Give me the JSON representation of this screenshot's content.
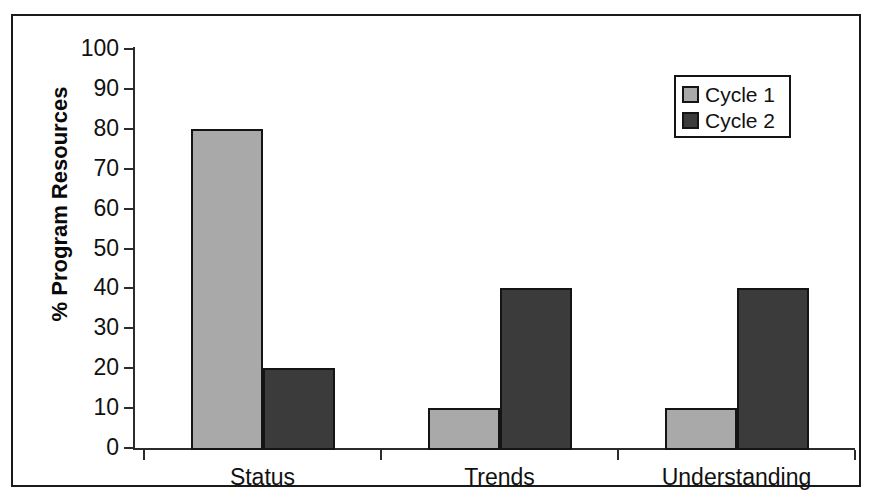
{
  "chart_data": {
    "type": "bar",
    "title": "",
    "subtitle": "",
    "xlabel": "",
    "ylabel": "% Program Resources",
    "categories": [
      "Status",
      "Trends",
      "Understanding"
    ],
    "series": [
      {
        "name": "Cycle 1",
        "color": "#a9a9a9",
        "values": [
          80,
          10,
          10
        ]
      },
      {
        "name": "Cycle 2",
        "color": "#3b3b3b",
        "values": [
          20,
          40,
          40
        ]
      }
    ],
    "ylim": [
      0,
      100
    ],
    "ytick_step": 10,
    "ytick_labels": [
      "100",
      "90",
      "80",
      "70",
      "60",
      "50",
      "40",
      "30",
      "20",
      "10",
      "0"
    ],
    "grid": false,
    "legend_position": "top-right",
    "legend_entries": [
      "Cycle 1",
      "Cycle 2"
    ],
    "frame": true,
    "annotations": []
  },
  "axis": {
    "y_title": "% Program Resources"
  },
  "legend": {
    "items": [
      {
        "label": "Cycle 1"
      },
      {
        "label": "Cycle 2"
      }
    ]
  }
}
